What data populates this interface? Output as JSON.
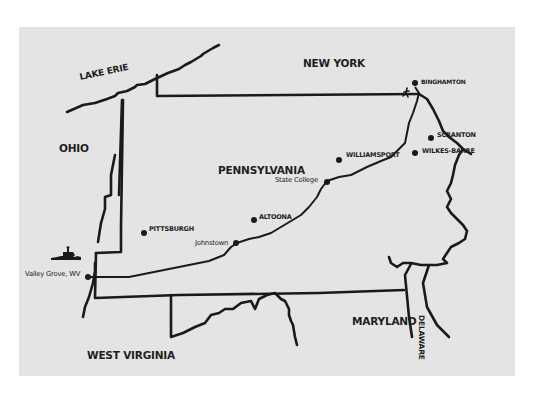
{
  "map": {
    "title": "",
    "colors": {
      "paper": "#e4e4e4",
      "ink": "#1a1a1a",
      "background": "#ffffff"
    },
    "regions": {
      "lake_erie": "LAKE ERIE",
      "new_york": "NEW YORK",
      "ohio": "OHIO",
      "pennsylvania": "PENNSYLVANIA",
      "maryland": "MARYLAND",
      "west_virginia": "WEST VIRGINIA",
      "delaware": "DELAWARE"
    },
    "cities": {
      "binghamton": "BINGHAMTON",
      "scranton": "SCRANTON",
      "wilkes_barre": "WILKES-BARRE",
      "williamsport": "WILLIAMSPORT",
      "state_college": "State College",
      "altoona": "ALTOONA",
      "johnstown": "Johnstown",
      "pittsburgh": "PITTSBURGH",
      "valley_grove": "Valley Grove, WV"
    },
    "icons": {
      "start_marker": "horse-rider-icon",
      "end_marker": "walker-icon"
    }
  }
}
